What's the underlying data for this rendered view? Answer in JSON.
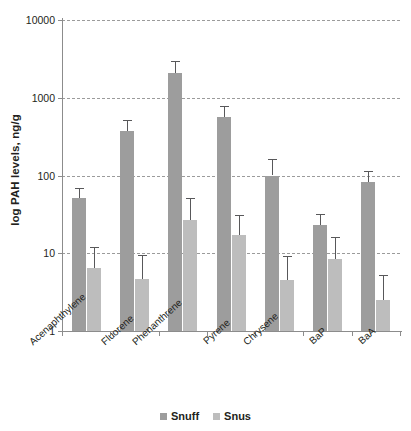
{
  "chart_data": {
    "type": "bar",
    "title": "",
    "xlabel": "",
    "ylabel": "log PAH levels, ng/g",
    "yscale": "log",
    "ylim": [
      1,
      10000
    ],
    "ytick_labels": [
      "10000",
      "1000",
      "100",
      "10",
      "1"
    ],
    "yticks": [
      10000,
      1000,
      100,
      10,
      1
    ],
    "grid": true,
    "legend_position": "bottom",
    "categories": [
      "Acenaphthylene",
      "Fluorene",
      "Phenanthrene",
      "Pyrene",
      "Chrysene",
      "BaP",
      "BaA"
    ],
    "series": [
      {
        "name": "Snuff",
        "color": "#9d9d9d",
        "values": [
          52,
          370,
          2100,
          570,
          100,
          23,
          83
        ],
        "err_high": [
          70,
          520,
          3000,
          780,
          165,
          32,
          115
        ],
        "err_low": [
          52,
          370,
          2100,
          570,
          100,
          23,
          83
        ]
      },
      {
        "name": "Snus",
        "color": "#bdbdbd",
        "values": [
          6.5,
          4.6,
          27,
          17,
          4.5,
          8.5,
          2.5
        ],
        "err_high": [
          12,
          9.5,
          52,
          31,
          9.3,
          16,
          5.3
        ],
        "err_low": [
          6.5,
          4.6,
          27,
          17,
          4.5,
          8.5,
          2.5
        ]
      }
    ]
  },
  "legend": {
    "items": [
      {
        "label": "Snuff",
        "color": "#9d9d9d"
      },
      {
        "label": "Snus",
        "color": "#bdbdbd"
      }
    ]
  },
  "axis": {
    "y_title": "log PAH levels, ng/g"
  }
}
